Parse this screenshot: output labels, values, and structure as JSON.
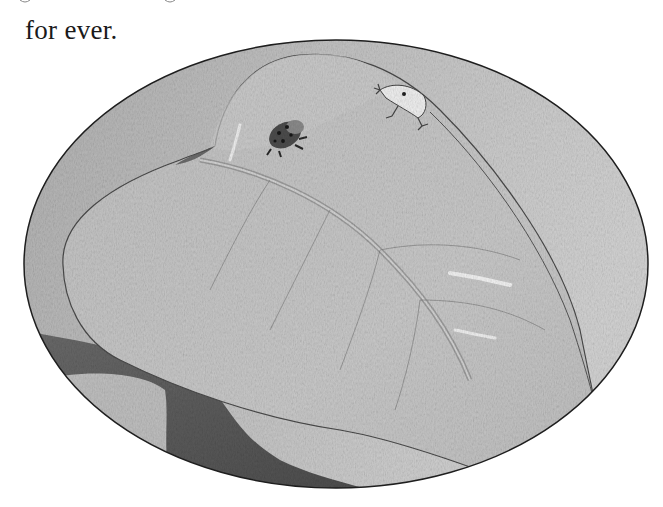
{
  "page": {
    "text_line": "for ever."
  },
  "illustration": {
    "shape": "oval",
    "subject": "pencil drawing of a large leaf with two small frogs",
    "elements": [
      {
        "name": "spotted-frog",
        "description": "dark spotted frog sitting on leaf"
      },
      {
        "name": "white-frog",
        "description": "pale frog clinging to leaf edge"
      },
      {
        "name": "leaf",
        "description": "large leaf with central midrib"
      },
      {
        "name": "shadow-band",
        "description": "dark shaded curve at lower left"
      }
    ],
    "colors": {
      "frame_stroke": "#1e1e1e",
      "background_fill": "#b9b9b9",
      "leaf_fill": "#c4c4c4",
      "shadow": "#5a5a5a",
      "light_area": "#d6d6d6"
    }
  }
}
